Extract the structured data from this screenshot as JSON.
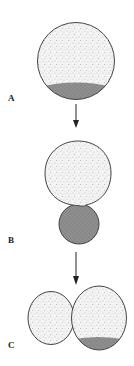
{
  "figure": {
    "stages": [
      {
        "label": "A",
        "description": "single cell with dark vegetal region at bottom"
      },
      {
        "label": "B",
        "description": "polar lobe formation: large stippled cell with small dark lobe below"
      },
      {
        "label": "C",
        "description": "two-cell stage: smaller left blastomere and larger right blastomere containing dark region"
      }
    ],
    "arrows": 2
  },
  "colors": {
    "background": "#ffffff",
    "outline": "#444444",
    "stipple": "#9a9a9a",
    "cytoplasm": "#f2f2f2",
    "dark_region": "#8c8c8c",
    "label": "#222222"
  }
}
